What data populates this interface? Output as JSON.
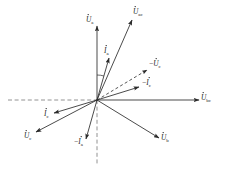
{
  "figure": {
    "kind": "phasor-diagram",
    "title": "",
    "background_color": "#ffffff",
    "line_color": "#2b2b2b",
    "axis_color": "#6f6f6f",
    "origin": {
      "x": 97,
      "y": 100
    }
  },
  "chart_data": {
    "type": "scatter",
    "subtype": "phasor-vector-diagram",
    "title": "",
    "xlabel": "",
    "ylabel": "",
    "grid": false,
    "legend": false,
    "origin": {
      "x": 97,
      "y": 100
    },
    "angle_convention": "degrees, counter-clockwise from positive x-axis",
    "reference_axes": [
      {
        "name": "horizontal-reference-axis",
        "style": "dashed",
        "from": {
          "x": 8,
          "y": 100
        },
        "to": {
          "x": 97,
          "y": 100
        },
        "arrow": false
      },
      {
        "name": "vertical-reference-axis",
        "style": "dashed",
        "from": {
          "x": 97,
          "y": 100
        },
        "to": {
          "x": 97,
          "y": 164
        },
        "arrow": false
      }
    ],
    "vectors": [
      {
        "id": "U_a",
        "label": "U",
        "subscript": "a",
        "has_overdot": true,
        "negated": false,
        "style": "solid",
        "angle_deg": 90,
        "length_px": 74,
        "tip": {
          "x": 97,
          "y": 26
        },
        "label_pos": {
          "x": 86,
          "y": 22
        }
      },
      {
        "id": "U_ac",
        "label": "U",
        "subscript": "ac",
        "has_overdot": true,
        "negated": false,
        "style": "solid",
        "angle_deg": 68,
        "length_px": 86,
        "tip": {
          "x": 132,
          "y": 20
        },
        "label_pos": {
          "x": 133,
          "y": 14
        }
      },
      {
        "id": "U_bc",
        "label": "U",
        "subscript": "bc",
        "has_overdot": true,
        "negated": false,
        "style": "solid",
        "angle_deg": 0,
        "length_px": 102,
        "tip": {
          "x": 199,
          "y": 100
        },
        "label_pos": {
          "x": 201,
          "y": 100
        }
      },
      {
        "id": "U_b",
        "label": "U",
        "subscript": "b",
        "has_overdot": true,
        "negated": false,
        "style": "solid",
        "angle_deg": -31,
        "length_px": 72,
        "tip": {
          "x": 159,
          "y": 138
        },
        "label_pos": {
          "x": 161,
          "y": 140
        }
      },
      {
        "id": "U_c",
        "label": "U",
        "subscript": "c",
        "has_overdot": true,
        "negated": false,
        "style": "solid",
        "angle_deg": -150,
        "length_px": 71,
        "tip": {
          "x": 36,
          "y": 132
        },
        "label_pos": {
          "x": 24,
          "y": 138
        }
      },
      {
        "id": "neg_U_c",
        "label": "U",
        "subscript": "c",
        "has_overdot": true,
        "negated": true,
        "style": "dashed",
        "angle_deg": 31,
        "length_px": 58,
        "tip": {
          "x": 147,
          "y": 70
        },
        "label_pos": {
          "x": 149,
          "y": 66
        }
      },
      {
        "id": "I_a",
        "label": "I",
        "subscript": "a",
        "has_overdot": true,
        "negated": false,
        "style": "solid",
        "angle_deg": 74,
        "length_px": 44,
        "tip": {
          "x": 109,
          "y": 58
        },
        "label_pos": {
          "x": 104,
          "y": 53
        }
      },
      {
        "id": "neg_I_a",
        "label": "I",
        "subscript": "a",
        "has_overdot": true,
        "negated": true,
        "style": "solid",
        "angle_deg": -106,
        "length_px": 41,
        "tip": {
          "x": 86,
          "y": 139
        },
        "label_pos": {
          "x": 74,
          "y": 144
        }
      },
      {
        "id": "neg_I_c",
        "label": "I",
        "subscript": "c",
        "has_overdot": true,
        "negated": true,
        "style": "solid",
        "angle_deg": 17,
        "length_px": 44,
        "tip": {
          "x": 139,
          "y": 87
        },
        "label_pos": {
          "x": 142,
          "y": 85
        }
      },
      {
        "id": "I_c",
        "label": "I",
        "subscript": "c",
        "has_overdot": true,
        "negated": false,
        "style": "solid",
        "angle_deg": 197,
        "length_px": 45,
        "tip": {
          "x": 54,
          "y": 113
        },
        "label_pos": {
          "x": 44,
          "y": 116
        }
      }
    ],
    "angle_arcs": [
      {
        "name": "phi-a",
        "between": [
          "U_a",
          "I_a"
        ],
        "radius_px": 25,
        "start_angle_deg": 74,
        "end_angle_deg": 90,
        "label": ""
      }
    ]
  },
  "labels": {
    "U_a": {
      "text": "U",
      "sub": "a",
      "prefix": ""
    },
    "U_ac": {
      "text": "U",
      "sub": "ac",
      "prefix": ""
    },
    "U_bc": {
      "text": "U",
      "sub": "bc",
      "prefix": ""
    },
    "U_b": {
      "text": "U",
      "sub": "b",
      "prefix": ""
    },
    "U_c": {
      "text": "U",
      "sub": "c",
      "prefix": ""
    },
    "neg_U_c": {
      "text": "U",
      "sub": "c",
      "prefix": "−"
    },
    "I_a": {
      "text": "I",
      "sub": "a",
      "prefix": ""
    },
    "neg_I_a": {
      "text": "I",
      "sub": "a",
      "prefix": "−"
    },
    "neg_I_c": {
      "text": "I",
      "sub": "c",
      "prefix": "−"
    },
    "I_c": {
      "text": "I",
      "sub": "c",
      "prefix": ""
    }
  }
}
